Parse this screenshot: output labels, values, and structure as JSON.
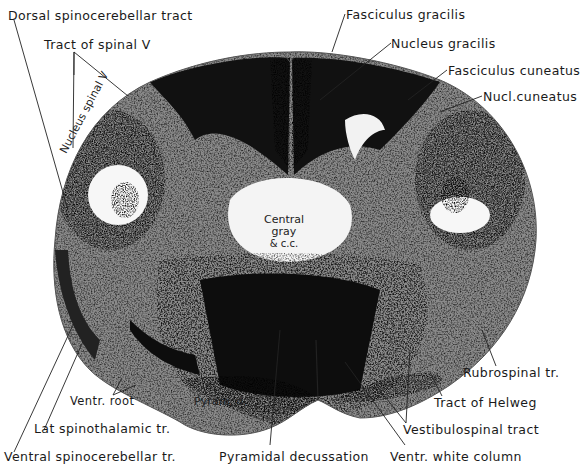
{
  "figure": {
    "colors": {
      "background": "#ffffff",
      "ink": "#111111",
      "white_matter_dark": "#151515",
      "gray_matter_light": "#e9e9e9",
      "outline": "#555555"
    }
  },
  "labels": {
    "dorsal_spinocerebellar": "Dorsal spinocerebellar tract",
    "tract_spinal_v": "Tract of spinal V",
    "fasciculus_gracilis": "Fasciculus gracilis",
    "nucleus_gracilis": "Nucleus gracilis",
    "fasciculus_cuneatus": "Fasciculus cuneatus",
    "nucl_cuneatus": "Nucl.cuneatus",
    "nucleus_spinal_v": "Nucleus spinal V",
    "central_gray_line1": "Central",
    "central_gray_line2": "gray",
    "central_gray_line3": "& c.c.",
    "pyramid": "Pyram. d.",
    "ventr_root": "Ventr. root",
    "lat_spinothalamic": "Lat spinothalamic tr.",
    "ventral_spinocerebellar": "Ventral spinocerebellar tr.",
    "pyramidal_decussation": "Pyramidal decussation",
    "ventr_white_column": "Ventr. white column",
    "vestibulospinal": "Vestibulospinal tract",
    "tract_of_helweg": "Tract of Helweg",
    "rubrospinal": "Rubrospinal tr."
  }
}
